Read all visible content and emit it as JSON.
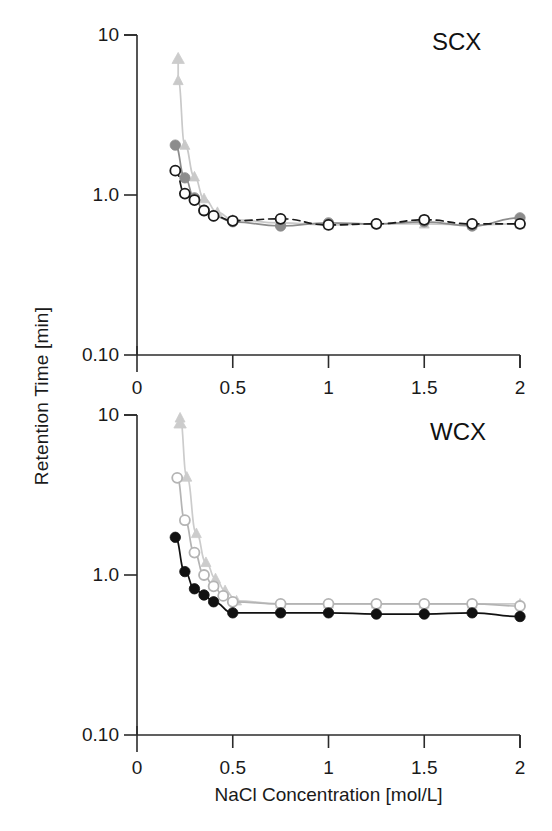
{
  "figure": {
    "ylabel": "Retention Time [min]",
    "xlabel": "NaCl Concentration [mol/L]"
  },
  "chart_data": [
    {
      "type": "scatter",
      "title": "SCX",
      "xlabel": "",
      "ylabel": "Retention Time [min]",
      "xlim": [
        0,
        2
      ],
      "ylim": [
        0.1,
        10
      ],
      "yscale": "log",
      "xticks": [
        0,
        0.5,
        1,
        1.5,
        2
      ],
      "xticklabels": [
        "0",
        "0.5",
        "1",
        "1.5",
        "2"
      ],
      "yticks": [
        0.1,
        1.0,
        10
      ],
      "yticklabels": [
        "0.10",
        "1.0",
        "10"
      ],
      "grid": false,
      "legend": "none",
      "annotations": [
        {
          "text": "off-scale arrow",
          "x": 0.215,
          "y": 5.2,
          "marker": "up-arrow"
        }
      ],
      "series": [
        {
          "name": "open-circle-dark",
          "marker": "open-circle",
          "color": "#1a1a1a",
          "line": "dashed",
          "x": [
            0.2,
            0.25,
            0.3,
            0.35,
            0.4,
            0.5,
            0.75,
            1.0,
            1.25,
            1.5,
            1.75,
            2.0
          ],
          "values": [
            1.42,
            1.02,
            0.93,
            0.8,
            0.74,
            0.69,
            0.71,
            0.65,
            0.66,
            0.7,
            0.66,
            0.66
          ]
        },
        {
          "name": "filled-circle-gray",
          "marker": "filled-circle",
          "color": "#8c8c8c",
          "line": "solid",
          "x": [
            0.2,
            0.25,
            0.3,
            0.35,
            0.4,
            0.5,
            0.75,
            1.0,
            1.25,
            1.5,
            1.75,
            2.0
          ],
          "values": [
            2.05,
            1.28,
            0.96,
            0.8,
            0.74,
            0.68,
            0.64,
            0.67,
            0.66,
            0.68,
            0.64,
            0.72
          ]
        },
        {
          "name": "triangle-light-gray",
          "marker": "triangle",
          "color": "#c9c9c9",
          "line": "solid",
          "x": [
            0.215,
            0.25,
            0.3,
            0.35,
            0.42,
            0.5,
            0.75,
            1.0,
            1.25,
            1.5,
            1.75,
            2.0
          ],
          "values": [
            5.2,
            2.05,
            1.3,
            0.95,
            0.78,
            0.7,
            0.67,
            0.65,
            0.66,
            0.66,
            0.65,
            0.66
          ]
        }
      ]
    },
    {
      "type": "scatter",
      "title": "WCX",
      "xlabel": "NaCl Concentration [mol/L]",
      "ylabel": "Retention Time [min]",
      "xlim": [
        0,
        2
      ],
      "ylim": [
        0.1,
        10
      ],
      "yscale": "log",
      "xticks": [
        0,
        0.5,
        1,
        1.5,
        2
      ],
      "xticklabels": [
        "0",
        "0.5",
        "1",
        "1.5",
        "2"
      ],
      "yticks": [
        0.1,
        1.0,
        10
      ],
      "yticklabels": [
        "0.10",
        "1.0",
        "10"
      ],
      "grid": false,
      "legend": "none",
      "annotations": [
        {
          "text": "off-scale arrow",
          "x": 0.225,
          "y": 9.6,
          "marker": "up-arrow"
        }
      ],
      "series": [
        {
          "name": "filled-circle-black",
          "marker": "filled-circle",
          "color": "#111111",
          "line": "solid",
          "x": [
            0.2,
            0.25,
            0.3,
            0.35,
            0.4,
            0.5,
            0.75,
            1.0,
            1.25,
            1.5,
            1.75,
            2.0
          ],
          "values": [
            1.72,
            1.05,
            0.82,
            0.75,
            0.68,
            0.58,
            0.58,
            0.58,
            0.57,
            0.57,
            0.58,
            0.55
          ]
        },
        {
          "name": "open-circle-light-gray",
          "marker": "open-circle",
          "color": "#b4b4b4",
          "line": "solid",
          "x": [
            0.21,
            0.25,
            0.3,
            0.35,
            0.4,
            0.45,
            0.5,
            0.75,
            1.0,
            1.25,
            1.5,
            1.75,
            2.0
          ],
          "values": [
            4.05,
            2.2,
            1.38,
            1.0,
            0.85,
            0.74,
            0.68,
            0.66,
            0.66,
            0.66,
            0.66,
            0.66,
            0.64
          ]
        },
        {
          "name": "triangle-light-gray",
          "marker": "triangle",
          "color": "#cccccc",
          "line": "solid",
          "x": [
            0.225,
            0.26,
            0.31,
            0.36,
            0.41,
            0.46,
            0.52,
            0.75,
            1.0,
            1.25,
            1.5,
            1.75,
            2.0
          ],
          "values": [
            9.6,
            4.1,
            1.82,
            1.2,
            0.95,
            0.8,
            0.69,
            0.66,
            0.66,
            0.66,
            0.66,
            0.66,
            0.66
          ]
        }
      ]
    }
  ]
}
